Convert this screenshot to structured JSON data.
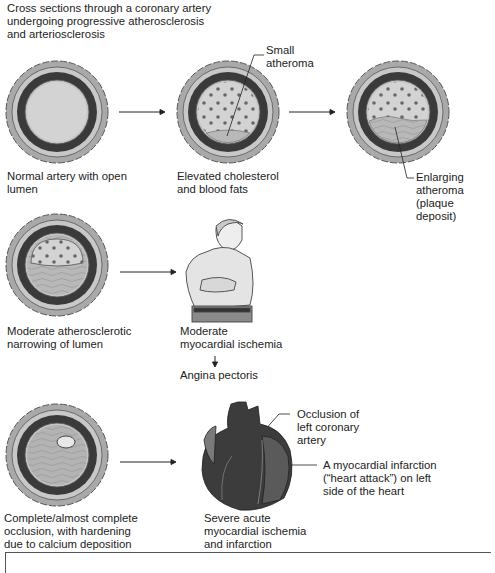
{
  "title": "Cross sections through a coronary artery\nundergoing progressive atherosclerosis\nand arteriosclerosis",
  "stages": [
    {
      "label": "Normal artery with open\nlumen",
      "state": "normal"
    },
    {
      "label": "Elevated cholesterol\nand blood fats",
      "callout": "Small\natheroma",
      "state": "small-atheroma"
    },
    {
      "label": "",
      "callout": "Enlarging atheroma\n(plaque deposit)",
      "state": "enlarging-atheroma"
    },
    {
      "label": "Moderate atherosclerotic\nnarrowing of lumen",
      "state": "moderate-narrowing"
    },
    {
      "label": "Complete/almost complete\nocclusion, with hardening\ndue to calcium deposition",
      "state": "occlusion"
    }
  ],
  "outcomes": {
    "moderate": {
      "label": "Moderate\nmyocardial ischemia",
      "result": "Angina pectoris"
    },
    "severe": {
      "label": "Severe acute\nmyocardial ischemia\nand infarction",
      "callout_occlusion": "Occlusion of\nleft coronary\nartery",
      "callout_infarction": "A myocardial infarction\n(“heart attack”) on left\nside of the heart"
    }
  },
  "colors": {
    "adventitia": "#a9a9a9",
    "media": "#3a3a3a",
    "intima": "#c4c4c4",
    "lumen": "#d3d3d3",
    "plaque": "#b8b8b8",
    "heart": "#3c3c3c",
    "line": "#222222"
  }
}
